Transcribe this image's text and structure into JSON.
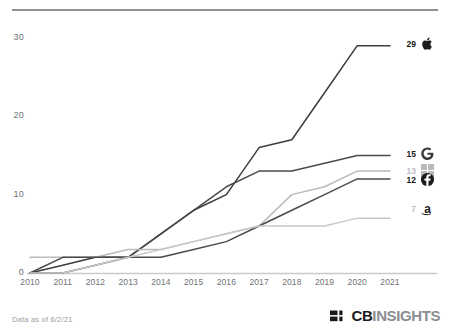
{
  "footer": {
    "data_note": "Data as of 6/2/21",
    "logo_primary": "CB",
    "logo_secondary": "INSIGHTS",
    "logo_mark_name": "cbinsights-mark"
  },
  "chart_data": {
    "type": "line",
    "title": "",
    "subtitle": "",
    "xlabel": "",
    "ylabel": "",
    "x": [
      2010,
      2011,
      2012,
      2013,
      2014,
      2015,
      2016,
      2017,
      2018,
      2019,
      2020,
      2021
    ],
    "xticklabels": [
      "2010",
      "2011",
      "2012",
      "2013",
      "2014",
      "2015",
      "2016",
      "2017",
      "2018",
      "2019",
      "2020",
      "2021"
    ],
    "yticklabels": [
      "0",
      "10",
      "20",
      "30"
    ],
    "yticks": [
      0,
      10,
      20,
      30
    ],
    "ylim": [
      0,
      31
    ],
    "xlim": [
      2010,
      2021
    ],
    "grid": false,
    "legend_position": "right-end-labels",
    "series": [
      {
        "name": "Apple",
        "icon": "apple-icon",
        "color": "#3c3c3c",
        "end_value": 29,
        "end_label": "29",
        "values": [
          0,
          1,
          2,
          2,
          5,
          8,
          10,
          16,
          17,
          23,
          29,
          29
        ]
      },
      {
        "name": "Google",
        "icon": "google-g-icon",
        "color": "#4a4a4a",
        "end_value": 15,
        "end_label": "15",
        "values": [
          0,
          0,
          1,
          2,
          5,
          8,
          11,
          13,
          13,
          14,
          15,
          15
        ]
      },
      {
        "name": "Microsoft",
        "icon": "microsoft-squares-icon",
        "color": "#b9babd",
        "end_value": 13,
        "end_label": "13",
        "values": [
          2,
          2,
          2,
          3,
          3,
          4,
          5,
          6,
          10,
          11,
          13,
          13
        ]
      },
      {
        "name": "Facebook",
        "icon": "facebook-f-icon",
        "color": "#4a4a4a",
        "end_value": 12,
        "end_label": "12",
        "values": [
          0,
          2,
          2,
          2,
          2,
          3,
          4,
          6,
          8,
          10,
          12,
          12
        ]
      },
      {
        "name": "Amazon",
        "icon": "amazon-a-icon",
        "color": "#c8c9cc",
        "end_value": 7,
        "end_label": "7",
        "values": [
          0,
          0,
          1,
          2,
          3,
          4,
          5,
          6,
          6,
          6,
          7,
          7
        ]
      }
    ]
  }
}
